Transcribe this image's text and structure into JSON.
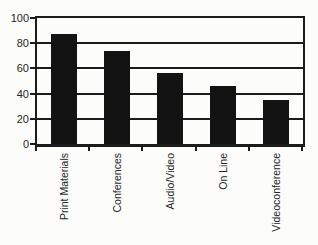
{
  "chart_data": {
    "type": "bar",
    "title": "",
    "xlabel": "",
    "ylabel": "",
    "categories": [
      "Print Materials",
      "Conferences",
      "Audio/Video",
      "On Line",
      "Videoconference"
    ],
    "values": [
      87,
      74,
      56,
      46,
      35
    ],
    "ylim": [
      0,
      100
    ],
    "yticks": [
      0,
      20,
      40,
      60,
      80,
      100
    ],
    "grid": true,
    "legend_position": "none",
    "x_label_rotation_degrees": -90,
    "bar_color": "#131313",
    "axis_color": "#1b1b1b",
    "text_color": "#262626",
    "background": "#fcfcfa"
  }
}
